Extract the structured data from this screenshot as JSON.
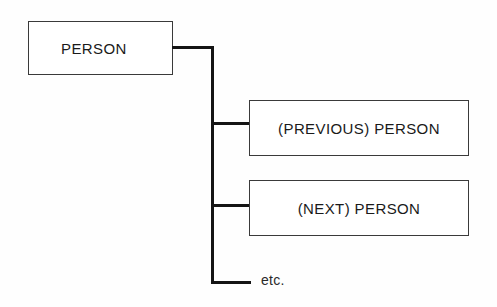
{
  "diagram": {
    "type": "tree-hierarchy",
    "root": {
      "id": "person",
      "label": "PERSON"
    },
    "branches": [
      {
        "id": "previous-person",
        "label": "(PREVIOUS) PERSON"
      },
      {
        "id": "next-person",
        "label": "(NEXT) PERSON"
      }
    ],
    "continuation": {
      "id": "etc",
      "label": "etc."
    },
    "colors": {
      "background": "#fefefe",
      "box_border": "#3a3a3a",
      "box_fill": "#ffffff",
      "connector": "#141414",
      "text": "#1a1a1a"
    }
  }
}
